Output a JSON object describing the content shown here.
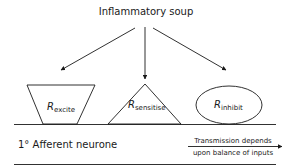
{
  "title": "Inflammatory soup",
  "receptors": [
    {
      "base": "R",
      "sub": "excite",
      "shape": "trapezoid"
    },
    {
      "base": "R",
      "sub": "sensitise",
      "shape": "triangle"
    },
    {
      "base": "R",
      "sub": "inhibit",
      "shape": "ellipse"
    }
  ],
  "neurone_label": "1° Afferent neurone",
  "transmission": {
    "line1": "Transmission depends",
    "line2": "upon balance of inputs"
  },
  "colors": {
    "stroke": "#1a1a1a",
    "background": "#ffffff"
  }
}
